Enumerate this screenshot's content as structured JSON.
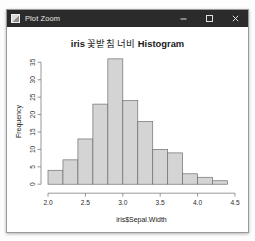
{
  "window": {
    "title": "Plot Zoom",
    "icon": "app-icon",
    "controls": {
      "minimize": "minimize-icon",
      "maximize": "maximize-icon",
      "close": "close-icon"
    }
  },
  "chart_data": {
    "type": "bar",
    "title": "iris 꽃받침 너비 Histogram",
    "title_parts": {
      "latin_prefix": "iris",
      "korean": "꽃받침 너비",
      "latin_suffix": "Histogram"
    },
    "xlabel": "iris$Sepal.Width",
    "ylabel": "Frequency",
    "bin_width": 0.2,
    "bin_edges": [
      2.0,
      2.2,
      2.4,
      2.6,
      2.8,
      3.0,
      3.2,
      3.4,
      3.6,
      3.8,
      4.0,
      4.2,
      4.4
    ],
    "categories": [
      "2.0-2.2",
      "2.2-2.4",
      "2.4-2.6",
      "2.6-2.8",
      "2.8-3.0",
      "3.0-3.2",
      "3.2-3.4",
      "3.4-3.6",
      "3.6-3.8",
      "3.8-4.0",
      "4.0-4.2",
      "4.2-4.4"
    ],
    "values": [
      4,
      7,
      13,
      23,
      36,
      24,
      18,
      10,
      9,
      3,
      2,
      1
    ],
    "xlim": [
      2.0,
      4.5
    ],
    "ylim": [
      0,
      36
    ],
    "xticks": [
      "2.0",
      "2.5",
      "3.0",
      "3.5",
      "4.0",
      "4.5"
    ],
    "xtick_values": [
      2.0,
      2.5,
      3.0,
      3.5,
      4.0,
      4.5
    ],
    "yticks": [
      "0",
      "5",
      "10",
      "15",
      "20",
      "25",
      "30",
      "35"
    ],
    "ytick_values": [
      0,
      5,
      10,
      15,
      20,
      25,
      30,
      35
    ],
    "grid": false,
    "legend": null,
    "bar_fill": "#d4d4d4",
    "bar_border": "#6f6f6f"
  }
}
